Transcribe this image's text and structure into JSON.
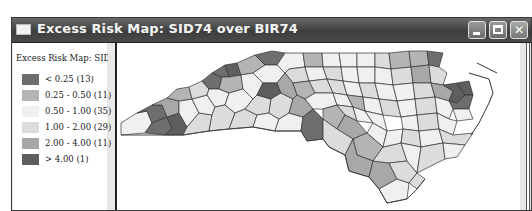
{
  "window": {
    "title": "Excess Risk Map: SID74 over BIR74",
    "controls": {
      "minimize": "minimize",
      "maximize": "maximize",
      "close": "close"
    }
  },
  "legend": {
    "title": "Excess Risk Map: SID74 o",
    "items": [
      {
        "label": "< 0.25 (13)",
        "color": "#6e6e6e"
      },
      {
        "label": "0.25 - 0.50 (11)",
        "color": "#b4b4b4"
      },
      {
        "label": "0.50 - 1.00 (35)",
        "color": "#f0f0f0"
      },
      {
        "label": "1.00 - 2.00 (29)",
        "color": "#dcdcdc"
      },
      {
        "label": "2.00 - 4.00 (11)",
        "color": "#a8a8a8"
      },
      {
        "label": "> 4.00 (1)",
        "color": "#5e5e5e"
      }
    ]
  },
  "map": {
    "region": "North Carolina counties",
    "variable": "Excess risk SID74 / BIR74"
  }
}
